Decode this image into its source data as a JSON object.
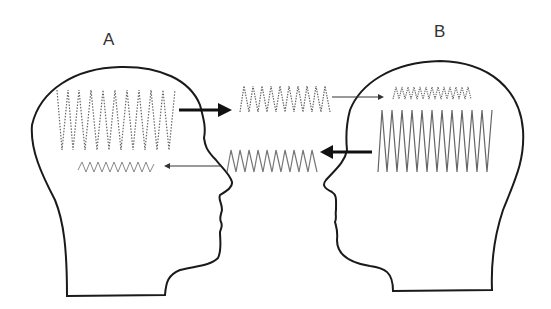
{
  "diagram": {
    "type": "communication-signal-diagram",
    "persons": [
      {
        "id": "A",
        "label": "A",
        "facing": "right"
      },
      {
        "id": "B",
        "label": "B",
        "facing": "left"
      }
    ],
    "signals": [
      {
        "name": "A-internal-strong-signal",
        "style": "dotted",
        "amplitude": "large",
        "location": "head A"
      },
      {
        "name": "A-to-B-transmitted-signal",
        "style": "dotted",
        "amplitude": "medium",
        "location": "between heads, top"
      },
      {
        "name": "B-received-weak-signal",
        "style": "dotted",
        "amplitude": "small",
        "location": "head B"
      },
      {
        "name": "B-internal-strong-signal",
        "style": "solid",
        "amplitude": "large",
        "location": "head B"
      },
      {
        "name": "B-to-A-transmitted-signal",
        "style": "solid",
        "amplitude": "medium",
        "location": "between heads, bottom"
      },
      {
        "name": "A-received-weak-signal",
        "style": "solid",
        "amplitude": "small",
        "location": "head A"
      }
    ],
    "arrows": [
      {
        "from": "A",
        "to": "middle-top",
        "weight": "thick"
      },
      {
        "from": "middle-top",
        "to": "B",
        "weight": "thin"
      },
      {
        "from": "B",
        "to": "middle-bottom",
        "weight": "thick"
      },
      {
        "from": "middle-bottom",
        "to": "A",
        "weight": "thin"
      }
    ],
    "colors": {
      "outline": "#1a1a1a",
      "wave": "#555555",
      "background": "#ffffff"
    }
  }
}
